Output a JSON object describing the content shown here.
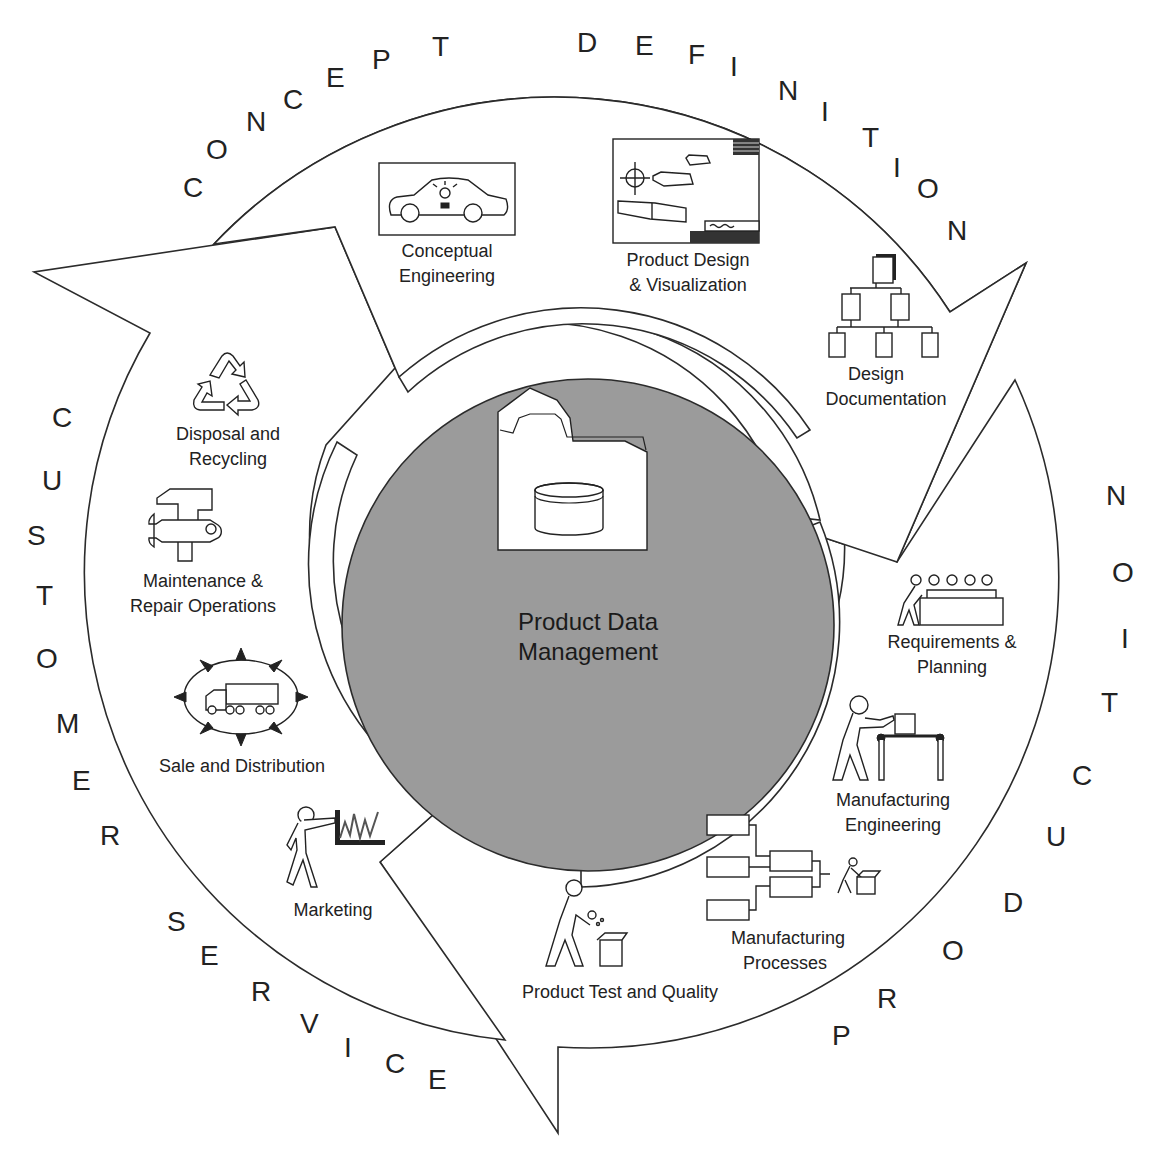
{
  "diagram": {
    "center": {
      "title_line1": "Product Data",
      "title_line2": "Management",
      "icon": "folder-database-icon",
      "fill_color": "#9b9b9b"
    },
    "ring_labels": {
      "concept_definition": [
        "C",
        "O",
        "N",
        "C",
        "E",
        "P",
        "T",
        "D",
        "E",
        "F",
        "I",
        "N",
        "I",
        "T",
        "I",
        "O",
        "N"
      ],
      "production": [
        "P",
        "R",
        "O",
        "D",
        "U",
        "C",
        "T",
        "I",
        "O",
        "N"
      ],
      "customer_service": [
        "C",
        "U",
        "S",
        "T",
        "O",
        "M",
        "E",
        "R",
        "S",
        "E",
        "R",
        "V",
        "I",
        "C",
        "E"
      ]
    },
    "phases": [
      {
        "name": "Concept Definition",
        "activities": [
          {
            "line1": "Conceptual",
            "line2": "Engineering",
            "icon": "car-lightbulb-icon"
          },
          {
            "line1": "Product Design",
            "line2": "& Visualization",
            "icon": "cad-drawing-icon"
          },
          {
            "line1": "Design",
            "line2": "Documentation",
            "icon": "document-tree-icon"
          }
        ]
      },
      {
        "name": "Production",
        "activities": [
          {
            "line1": "Requirements &",
            "line2": "Planning",
            "icon": "meeting-table-icon"
          },
          {
            "line1": "Manufacturing",
            "line2": "Engineering",
            "icon": "conveyor-worker-icon"
          },
          {
            "line1": "Manufacturing",
            "line2": "Processes",
            "icon": "process-flow-icon"
          },
          {
            "line1": "Product Test and Quality",
            "line2": "",
            "icon": "inspector-box-icon"
          }
        ]
      },
      {
        "name": "Customer Service",
        "activities": [
          {
            "line1": "Marketing",
            "line2": "",
            "icon": "presenter-chart-icon"
          },
          {
            "line1": "Sale and Distribution",
            "line2": "",
            "icon": "truck-distribution-icon"
          },
          {
            "line1": "Maintenance &",
            "line2": "Repair Operations",
            "icon": "hammer-wrench-icon"
          },
          {
            "line1": "Disposal and",
            "line2": "Recycling",
            "icon": "recycle-icon"
          }
        ]
      }
    ]
  }
}
